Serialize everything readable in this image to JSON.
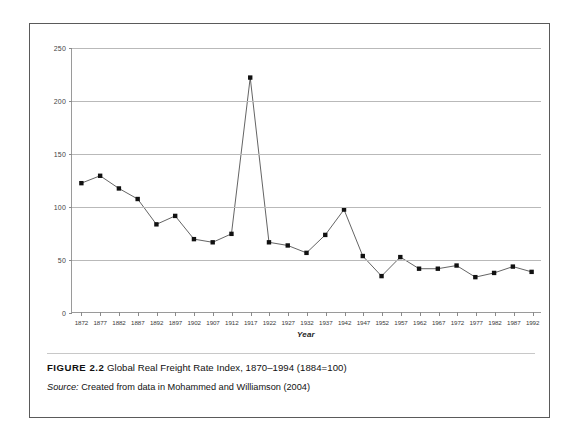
{
  "figure": {
    "label": "FIGURE 2.2",
    "caption_text": "Global Real Freight Rate Index, 1870–1994 (1884=100)",
    "source_word": "Source:",
    "source_text": "Created from data in Mohammed and Williamson (2004)"
  },
  "colors": {
    "frame": "#5a5a5a",
    "gridline": "#b9b9b9",
    "axis": "#9a9a9a",
    "line": "#3c3c3c",
    "marker": "#111111",
    "background": "#ffffff"
  },
  "chart_data": {
    "type": "line",
    "title": "",
    "xlabel": "Year",
    "ylabel": "",
    "xlim": [
      1870,
      1994
    ],
    "ylim": [
      0,
      250
    ],
    "ytick_values": [
      0,
      50,
      100,
      150,
      200,
      250
    ],
    "ytick_labels": [
      "0",
      "50",
      "100",
      "150",
      "200",
      "250"
    ],
    "grid": true,
    "legend": "none",
    "marker": "square",
    "x": [
      1872,
      1877,
      1882,
      1887,
      1892,
      1897,
      1902,
      1907,
      1912,
      1917,
      1922,
      1927,
      1932,
      1937,
      1942,
      1947,
      1952,
      1957,
      1962,
      1967,
      1972,
      1977,
      1982,
      1987,
      1992
    ],
    "xtick_labels": [
      "1872",
      "1877",
      "1882",
      "1887",
      "1892",
      "1897",
      "1902",
      "1907",
      "1912",
      "1917",
      "1922",
      "1927",
      "1932",
      "1937",
      "1942",
      "1947",
      "1952",
      "1957",
      "1962",
      "1967",
      "1972",
      "1977",
      "1982",
      "1987",
      "1992"
    ],
    "series": [
      {
        "name": "Global Real Freight Rate Index",
        "values": [
          122,
          129,
          117,
          107,
          83,
          91,
          69,
          66,
          74,
          222,
          66,
          63,
          56,
          73,
          97,
          53,
          34,
          52,
          41,
          41,
          44,
          33,
          37,
          43,
          38
        ]
      }
    ]
  }
}
